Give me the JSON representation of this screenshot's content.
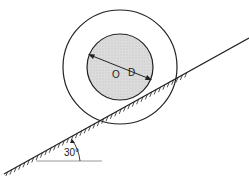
{
  "diagram": {
    "labels": {
      "center": "O",
      "diameter": "D",
      "angle": "30°"
    },
    "incline_angle_deg": 30,
    "colors": {
      "stroke": "#222222",
      "inner_fill": "#d9d9d9",
      "background": "#ffffff",
      "ground_line": "#999999"
    }
  }
}
